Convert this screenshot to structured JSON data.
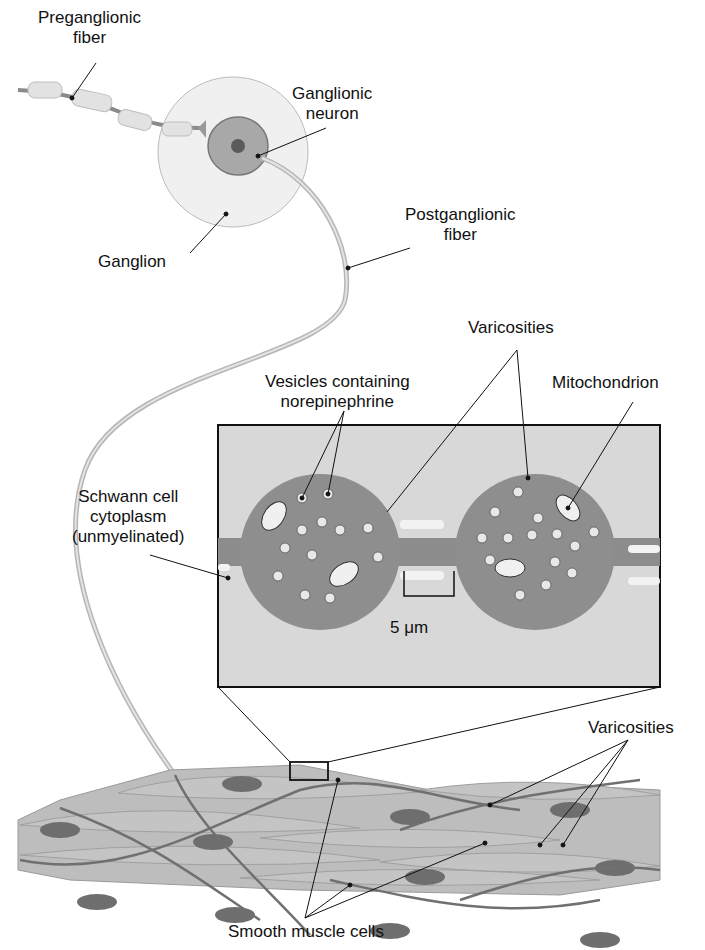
{
  "labels": {
    "preganglionic_fiber": [
      "Preganglionic",
      "fiber"
    ],
    "ganglionic_neuron": [
      "Ganglionic",
      "neuron"
    ],
    "ganglion": "Ganglion",
    "postganglionic_fiber": [
      "Postganglionic",
      "fiber"
    ],
    "varicosities_top": "Varicosities",
    "vesicles": [
      "Vesicles containing",
      "norepinephrine"
    ],
    "mitochondrion": "Mitochondrion",
    "schwann_cell": [
      "Schwann cell",
      "cytoplasm",
      "(unmyelinated)"
    ],
    "scale_bar": "5 μm",
    "varicosities_bottom": "Varicosities",
    "smooth_muscle_cells": "Smooth muscle cells"
  },
  "colors": {
    "background": "#ffffff",
    "fiber": "#b0b0b0",
    "neuron_body": "#9a9a9a",
    "ganglion_fill": "#efefef",
    "inset_bg": "#d6d6d6",
    "varicosity_fill": "#8c8c8c",
    "muscle_fill": "#b8b8b8",
    "nucleus_fill": "#6a6a6a",
    "leader_line": "#111111"
  }
}
